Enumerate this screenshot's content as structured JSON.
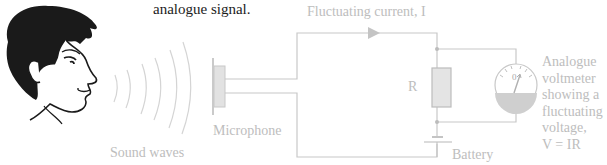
{
  "caption": {
    "text": "analogue signal."
  },
  "labels": {
    "sound_waves": "Sound waves",
    "microphone": "Microphone",
    "current": "Fluctuating current, I",
    "resistor": "R",
    "battery": "Battery",
    "voltmeter": [
      "Analogue",
      "voltmeter",
      "showing a",
      "fluctuating",
      "voltage,",
      "V = IR"
    ]
  },
  "meter": {
    "reading": "0"
  },
  "colors": {
    "line": "#c8c8c8",
    "fill": "#e4e4e4",
    "text_dark": "#1c1c1c",
    "text_light": "#bdbdbd",
    "meter_fill": "#cfcfcf"
  }
}
